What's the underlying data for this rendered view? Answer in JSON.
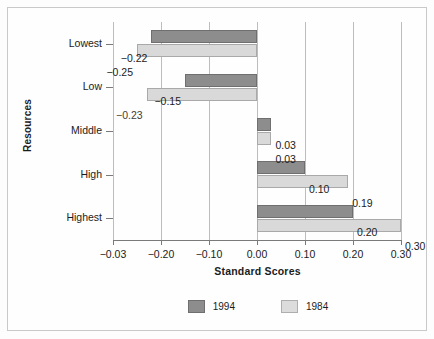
{
  "chart_data": {
    "type": "bar",
    "orientation": "horizontal",
    "title": "",
    "xlabel": "Standard Scores",
    "ylabel": "Resources",
    "categories": [
      "Lowest",
      "Low",
      "Middle",
      "High",
      "Highest"
    ],
    "series": [
      {
        "name": "1994",
        "color": "#8d8d8d",
        "values": [
          -0.22,
          -0.15,
          0.03,
          0.1,
          0.2
        ]
      },
      {
        "name": "1984",
        "color": "#d9d9d9",
        "values": [
          -0.25,
          -0.23,
          0.03,
          0.19,
          0.3
        ]
      }
    ],
    "data_labels": {
      "1994": [
        "−0.22",
        "−0.15",
        "0.03",
        "0.10",
        "0.20"
      ],
      "1984": [
        "−0.25",
        "−0.23",
        "0.03",
        "0.19",
        "0.30"
      ]
    },
    "xlim": [
      -0.3,
      0.3
    ],
    "xticks": [
      -0.3,
      -0.2,
      -0.1,
      0.0,
      0.1,
      0.2,
      0.3
    ],
    "xticklabels": [
      "−0.03",
      "−0.20",
      "−0.10",
      "0.00",
      "0.10",
      "0.20",
      "0.30"
    ],
    "grid": "vertical",
    "legend_position": "bottom"
  },
  "legend": {
    "items": [
      {
        "label": "1994"
      },
      {
        "label": "1984"
      }
    ]
  }
}
